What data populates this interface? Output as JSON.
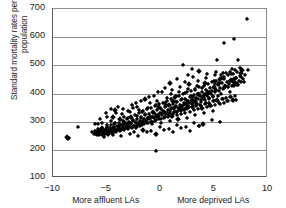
{
  "chart_data": {
    "type": "scatter",
    "title": "",
    "xlabel": "",
    "ylabel": "Standard mortality rates per 100 000 population",
    "ylabel_line1": "Standard mortality rates per 100 000",
    "ylabel_line2": "population",
    "xlim": [
      -10,
      10
    ],
    "ylim": [
      100,
      700
    ],
    "xticks": [
      -10,
      -5,
      0,
      5,
      10
    ],
    "xtick_labels": [
      "−10",
      "−5",
      "0",
      "5",
      "10"
    ],
    "yticks": [
      100,
      200,
      300,
      400,
      500,
      600,
      700
    ],
    "ytick_labels": [
      "100",
      "200",
      "300",
      "400",
      "500",
      "600",
      "700"
    ],
    "grid": "horizontal",
    "legend": "none",
    "marker": "diamond",
    "marker_color": "#000000",
    "axis_color": "#595959",
    "grid_color": "#8e8e8e",
    "x_axis_annotations": [
      {
        "text": "More affluent LAs",
        "x": -5
      },
      {
        "text": "More deprived LAs",
        "x": 5
      }
    ],
    "points": [
      [
        -8.68,
        245
      ],
      [
        -8.62,
        238
      ],
      [
        -8.55,
        241
      ],
      [
        -7.72,
        282
      ],
      [
        -6.35,
        262
      ],
      [
        -6.2,
        258
      ],
      [
        -6.05,
        268
      ],
      [
        -5.95,
        255
      ],
      [
        -5.86,
        273
      ],
      [
        -5.78,
        262
      ],
      [
        -5.7,
        258
      ],
      [
        -5.62,
        270
      ],
      [
        -5.55,
        265
      ],
      [
        -5.48,
        252
      ],
      [
        -5.4,
        279
      ],
      [
        -5.32,
        261
      ],
      [
        -5.25,
        268
      ],
      [
        -5.18,
        257
      ],
      [
        -5.1,
        275
      ],
      [
        -5.02,
        264
      ],
      [
        -4.95,
        282
      ],
      [
        -4.88,
        258
      ],
      [
        -4.8,
        270
      ],
      [
        -4.72,
        263
      ],
      [
        -4.65,
        288
      ],
      [
        -4.58,
        271
      ],
      [
        -4.5,
        260
      ],
      [
        -4.42,
        279
      ],
      [
        -4.35,
        266
      ],
      [
        -4.28,
        291
      ],
      [
        -4.2,
        274
      ],
      [
        -4.12,
        262
      ],
      [
        -4.05,
        285
      ],
      [
        -3.98,
        270
      ],
      [
        -3.9,
        296
      ],
      [
        -3.82,
        278
      ],
      [
        -3.75,
        266
      ],
      [
        -3.68,
        289
      ],
      [
        -3.6,
        274
      ],
      [
        -3.52,
        302
      ],
      [
        -3.45,
        282
      ],
      [
        -3.38,
        270
      ],
      [
        -3.3,
        294
      ],
      [
        -3.22,
        278
      ],
      [
        -3.15,
        309
      ],
      [
        -3.08,
        286
      ],
      [
        -3.0,
        274
      ],
      [
        -2.92,
        298
      ],
      [
        -2.85,
        282
      ],
      [
        -2.78,
        318
      ],
      [
        -2.7,
        290
      ],
      [
        -2.62,
        278
      ],
      [
        -2.55,
        304
      ],
      [
        -2.48,
        286
      ],
      [
        -2.4,
        325
      ],
      [
        -2.32,
        295
      ],
      [
        -2.25,
        282
      ],
      [
        -2.18,
        310
      ],
      [
        -2.1,
        292
      ],
      [
        -2.02,
        331
      ],
      [
        -1.95,
        300
      ],
      [
        -1.88,
        286
      ],
      [
        -1.8,
        316
      ],
      [
        -1.72,
        298
      ],
      [
        -1.65,
        338
      ],
      [
        -1.58,
        306
      ],
      [
        -1.5,
        290
      ],
      [
        -1.42,
        322
      ],
      [
        -1.35,
        303
      ],
      [
        -1.28,
        344
      ],
      [
        -1.2,
        312
      ],
      [
        -1.12,
        295
      ],
      [
        -1.05,
        328
      ],
      [
        -0.98,
        308
      ],
      [
        -0.9,
        350
      ],
      [
        -0.82,
        318
      ],
      [
        -0.75,
        300
      ],
      [
        -0.68,
        334
      ],
      [
        -0.6,
        314
      ],
      [
        -0.52,
        356
      ],
      [
        -0.45,
        324
      ],
      [
        -0.4,
        195
      ],
      [
        -0.38,
        305
      ],
      [
        -0.3,
        340
      ],
      [
        -0.22,
        320
      ],
      [
        -0.15,
        362
      ],
      [
        -0.08,
        330
      ],
      [
        0.0,
        310
      ],
      [
        0.08,
        346
      ],
      [
        0.15,
        326
      ],
      [
        0.22,
        368
      ],
      [
        0.3,
        336
      ],
      [
        0.38,
        316
      ],
      [
        0.45,
        352
      ],
      [
        0.52,
        332
      ],
      [
        0.6,
        374
      ],
      [
        0.68,
        342
      ],
      [
        0.75,
        322
      ],
      [
        0.82,
        358
      ],
      [
        0.9,
        338
      ],
      [
        0.98,
        380
      ],
      [
        1.05,
        348
      ],
      [
        1.12,
        328
      ],
      [
        1.2,
        364
      ],
      [
        1.28,
        344
      ],
      [
        1.35,
        386
      ],
      [
        1.42,
        354
      ],
      [
        1.5,
        334
      ],
      [
        1.58,
        370
      ],
      [
        1.65,
        350
      ],
      [
        1.72,
        392
      ],
      [
        1.8,
        360
      ],
      [
        1.88,
        340
      ],
      [
        1.95,
        376
      ],
      [
        2.02,
        356
      ],
      [
        2.1,
        398
      ],
      [
        2.18,
        366
      ],
      [
        2.25,
        346
      ],
      [
        2.32,
        382
      ],
      [
        2.4,
        362
      ],
      [
        2.48,
        404
      ],
      [
        2.55,
        372
      ],
      [
        2.62,
        352
      ],
      [
        2.7,
        388
      ],
      [
        2.78,
        368
      ],
      [
        2.85,
        410
      ],
      [
        2.92,
        378
      ],
      [
        3.0,
        358
      ],
      [
        3.08,
        394
      ],
      [
        3.15,
        374
      ],
      [
        3.22,
        416
      ],
      [
        3.3,
        384
      ],
      [
        3.38,
        364
      ],
      [
        3.45,
        400
      ],
      [
        3.52,
        380
      ],
      [
        3.6,
        285
      ],
      [
        3.62,
        422
      ],
      [
        3.7,
        390
      ],
      [
        3.78,
        370
      ],
      [
        3.85,
        406
      ],
      [
        3.92,
        386
      ],
      [
        4.0,
        428
      ],
      [
        4.08,
        396
      ],
      [
        4.15,
        376
      ],
      [
        4.22,
        412
      ],
      [
        4.3,
        392
      ],
      [
        4.38,
        434
      ],
      [
        4.45,
        402
      ],
      [
        4.52,
        382
      ],
      [
        4.6,
        418
      ],
      [
        4.68,
        398
      ],
      [
        4.75,
        440
      ],
      [
        4.82,
        408
      ],
      [
        4.9,
        388
      ],
      [
        4.98,
        424
      ],
      [
        5.05,
        404
      ],
      [
        5.12,
        446
      ],
      [
        5.2,
        414
      ],
      [
        5.28,
        519
      ],
      [
        5.35,
        430
      ],
      [
        5.42,
        410
      ],
      [
        5.5,
        452
      ],
      [
        5.58,
        420
      ],
      [
        5.65,
        466
      ],
      [
        5.72,
        436
      ],
      [
        5.8,
        416
      ],
      [
        5.88,
        458
      ],
      [
        5.95,
        578
      ],
      [
        6.02,
        426
      ],
      [
        6.1,
        472
      ],
      [
        6.18,
        442
      ],
      [
        6.25,
        422
      ],
      [
        6.32,
        464
      ],
      [
        6.4,
        434
      ],
      [
        6.48,
        478
      ],
      [
        6.55,
        448
      ],
      [
        6.62,
        428
      ],
      [
        6.7,
        470
      ],
      [
        6.78,
        440
      ],
      [
        6.85,
        592
      ],
      [
        6.92,
        484
      ],
      [
        7.0,
        454
      ],
      [
        7.08,
        434
      ],
      [
        7.15,
        476
      ],
      [
        7.22,
        519
      ],
      [
        7.3,
        446
      ],
      [
        7.38,
        490
      ],
      [
        7.45,
        460
      ],
      [
        7.52,
        440
      ],
      [
        7.6,
        482
      ],
      [
        7.68,
        452
      ],
      [
        7.75,
        440
      ],
      [
        7.82,
        466
      ],
      [
        8.05,
        663
      ],
      [
        8.12,
        484
      ],
      [
        -6.1,
        255
      ],
      [
        -5.9,
        262
      ],
      [
        -5.7,
        252
      ],
      [
        -5.5,
        268
      ],
      [
        -5.3,
        256
      ],
      [
        -5.1,
        272
      ],
      [
        -4.9,
        260
      ],
      [
        -4.7,
        276
      ],
      [
        -4.5,
        264
      ],
      [
        -4.3,
        280
      ],
      [
        -4.1,
        268
      ],
      [
        -3.9,
        284
      ],
      [
        -3.7,
        272
      ],
      [
        -3.5,
        288
      ],
      [
        -3.3,
        276
      ],
      [
        -3.1,
        292
      ],
      [
        -2.9,
        280
      ],
      [
        -2.7,
        296
      ],
      [
        -2.5,
        284
      ],
      [
        -2.3,
        300
      ],
      [
        -2.1,
        288
      ],
      [
        -1.9,
        304
      ],
      [
        -1.7,
        292
      ],
      [
        -1.5,
        308
      ],
      [
        -1.3,
        296
      ],
      [
        -1.1,
        312
      ],
      [
        -0.9,
        300
      ],
      [
        -0.7,
        316
      ],
      [
        -0.5,
        304
      ],
      [
        -0.3,
        320
      ],
      [
        -0.1,
        308
      ],
      [
        0.1,
        324
      ],
      [
        0.3,
        312
      ],
      [
        0.5,
        328
      ],
      [
        0.7,
        316
      ],
      [
        0.9,
        332
      ],
      [
        1.1,
        320
      ],
      [
        1.3,
        336
      ],
      [
        1.5,
        324
      ],
      [
        1.7,
        340
      ],
      [
        1.9,
        328
      ],
      [
        2.1,
        344
      ],
      [
        2.3,
        332
      ],
      [
        2.5,
        348
      ],
      [
        2.7,
        336
      ],
      [
        2.9,
        352
      ],
      [
        3.1,
        340
      ],
      [
        3.3,
        356
      ],
      [
        3.5,
        344
      ],
      [
        3.7,
        360
      ],
      [
        3.9,
        348
      ],
      [
        4.1,
        364
      ],
      [
        4.3,
        352
      ],
      [
        4.5,
        368
      ],
      [
        4.7,
        356
      ],
      [
        4.9,
        372
      ],
      [
        5.1,
        360
      ],
      [
        5.3,
        376
      ],
      [
        5.5,
        364
      ],
      [
        5.7,
        380
      ],
      [
        5.9,
        368
      ],
      [
        6.1,
        384
      ],
      [
        6.3,
        372
      ],
      [
        6.5,
        388
      ],
      [
        6.7,
        376
      ],
      [
        6.9,
        392
      ],
      [
        -5.8,
        290
      ],
      [
        -5.4,
        296
      ],
      [
        -5.0,
        288
      ],
      [
        -4.6,
        302
      ],
      [
        -4.2,
        294
      ],
      [
        -3.8,
        308
      ],
      [
        -3.4,
        300
      ],
      [
        -3.0,
        314
      ],
      [
        -2.6,
        306
      ],
      [
        -2.2,
        320
      ],
      [
        -1.8,
        312
      ],
      [
        -1.4,
        326
      ],
      [
        -1.0,
        318
      ],
      [
        -0.6,
        332
      ],
      [
        -0.2,
        324
      ],
      [
        0.2,
        338
      ],
      [
        0.6,
        330
      ],
      [
        1.0,
        344
      ],
      [
        1.4,
        336
      ],
      [
        1.8,
        350
      ],
      [
        2.2,
        342
      ],
      [
        2.6,
        356
      ],
      [
        3.0,
        348
      ],
      [
        3.4,
        362
      ],
      [
        3.8,
        354
      ],
      [
        4.2,
        368
      ],
      [
        4.6,
        360
      ],
      [
        5.0,
        374
      ],
      [
        5.4,
        366
      ],
      [
        5.8,
        380
      ],
      [
        6.2,
        372
      ],
      [
        6.6,
        386
      ],
      [
        7.0,
        378
      ],
      [
        -4.4,
        318
      ],
      [
        -3.6,
        326
      ],
      [
        -2.8,
        334
      ],
      [
        -2.0,
        342
      ],
      [
        -1.2,
        350
      ],
      [
        -0.4,
        358
      ],
      [
        0.4,
        366
      ],
      [
        1.2,
        374
      ],
      [
        2.0,
        382
      ],
      [
        2.8,
        390
      ],
      [
        3.6,
        398
      ],
      [
        4.4,
        406
      ],
      [
        5.2,
        414
      ],
      [
        6.0,
        422
      ],
      [
        6.8,
        430
      ],
      [
        -4.95,
        318
      ],
      [
        -4.15,
        330
      ],
      [
        -3.35,
        316
      ],
      [
        -2.55,
        348
      ],
      [
        -1.75,
        334
      ],
      [
        -0.95,
        366
      ],
      [
        -0.15,
        352
      ],
      [
        0.65,
        384
      ],
      [
        1.45,
        370
      ],
      [
        2.25,
        402
      ],
      [
        3.05,
        388
      ],
      [
        3.85,
        420
      ],
      [
        4.65,
        406
      ],
      [
        5.45,
        438
      ],
      [
        6.25,
        424
      ],
      [
        7.05,
        456
      ],
      [
        -3.05,
        338
      ],
      [
        -2.15,
        352
      ],
      [
        -1.25,
        344
      ],
      [
        -0.35,
        372
      ],
      [
        0.55,
        358
      ],
      [
        1.45,
        392
      ],
      [
        2.35,
        378
      ],
      [
        3.25,
        412
      ],
      [
        4.15,
        398
      ],
      [
        5.05,
        432
      ],
      [
        5.95,
        418
      ],
      [
        6.85,
        452
      ],
      [
        -5.25,
        246
      ],
      [
        -4.45,
        252
      ],
      [
        -3.65,
        248
      ],
      [
        -2.85,
        256
      ],
      [
        -2.05,
        250
      ],
      [
        -1.25,
        262
      ],
      [
        -0.45,
        256
      ],
      [
        0.35,
        270
      ],
      [
        1.15,
        262
      ],
      [
        1.95,
        278
      ],
      [
        2.75,
        268
      ],
      [
        3.55,
        286
      ],
      [
        -2.45,
        262
      ],
      [
        -1.65,
        272
      ],
      [
        -0.85,
        266
      ],
      [
        -0.05,
        280
      ],
      [
        0.75,
        274
      ],
      [
        1.55,
        288
      ],
      [
        2.35,
        282
      ],
      [
        3.15,
        296
      ],
      [
        3.95,
        290
      ],
      [
        4.75,
        306
      ],
      [
        5.55,
        298
      ],
      [
        0.95,
        398
      ],
      [
        1.75,
        406
      ],
      [
        2.55,
        416
      ],
      [
        3.35,
        426
      ],
      [
        4.15,
        436
      ],
      [
        4.95,
        446
      ],
      [
        5.75,
        456
      ],
      [
        6.55,
        468
      ],
      [
        7.35,
        462
      ],
      [
        1.05,
        412
      ],
      [
        1.85,
        424
      ],
      [
        2.65,
        434
      ],
      [
        3.45,
        444
      ],
      [
        4.25,
        454
      ],
      [
        5.05,
        464
      ],
      [
        5.85,
        474
      ],
      [
        6.65,
        486
      ],
      [
        2.45,
        366
      ],
      [
        3.25,
        374
      ],
      [
        4.05,
        382
      ],
      [
        4.85,
        390
      ],
      [
        5.65,
        398
      ],
      [
        6.45,
        406
      ],
      [
        1.35,
        352
      ],
      [
        2.15,
        360
      ],
      [
        2.95,
        368
      ],
      [
        3.75,
        376
      ],
      [
        4.55,
        384
      ],
      [
        5.35,
        392
      ],
      [
        -0.75,
        290
      ],
      [
        0.05,
        296
      ],
      [
        0.85,
        302
      ],
      [
        1.65,
        308
      ],
      [
        2.45,
        314
      ],
      [
        3.25,
        322
      ],
      [
        4.05,
        330
      ],
      [
        4.85,
        338
      ],
      [
        2.05,
        500
      ],
      [
        2.9,
        486
      ],
      [
        3.55,
        480
      ],
      [
        4.35,
        470
      ],
      [
        5.15,
        476
      ],
      [
        2.55,
        466
      ],
      [
        1.55,
        452
      ],
      [
        2.25,
        440
      ],
      [
        3.05,
        458
      ],
      [
        0.85,
        438
      ],
      [
        0.45,
        420
      ],
      [
        -0.25,
        404
      ],
      [
        -1.05,
        388
      ],
      [
        -1.85,
        372
      ],
      [
        -2.65,
        360
      ],
      [
        -3.45,
        346
      ],
      [
        -4.25,
        340
      ],
      [
        -5.05,
        330
      ],
      [
        -5.65,
        310
      ],
      [
        -6.05,
        292
      ],
      [
        -3.95,
        352
      ],
      [
        -4.65,
        344
      ],
      [
        -2.25,
        368
      ],
      [
        -1.45,
        380
      ],
      [
        -0.65,
        392
      ],
      [
        0.15,
        404
      ],
      [
        6.95,
        440
      ],
      [
        7.25,
        430
      ],
      [
        6.45,
        444
      ],
      [
        5.95,
        450
      ],
      [
        7.45,
        472
      ]
    ]
  }
}
